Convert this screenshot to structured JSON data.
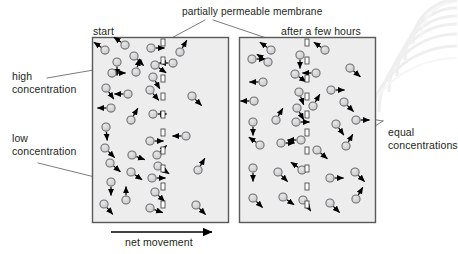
{
  "figure": {
    "type": "diagram",
    "canvas": {
      "width": 457,
      "height": 254,
      "background": "#ffffff"
    }
  },
  "labels": {
    "top_membrane": "partially permeable membrane",
    "panel_left_title": "start",
    "panel_right_title": "after a few hours",
    "high_concentration": "high\nconcentration",
    "high_concentration_line1": "high",
    "high_concentration_line2": "concentration",
    "low_concentration_line1": "low",
    "low_concentration_line2": "concentration",
    "equal_concentrations_line1": "equal",
    "equal_concentrations_line2": "concentrations",
    "net_movement": "net movement"
  },
  "colors": {
    "text": "#231f20",
    "panel_fill": "#ededed",
    "panel_stroke": "#58595b",
    "particle_fill": "#d2d3d4",
    "particle_stroke": "#6d6e70",
    "arrow": "#000000",
    "leader_line": "#58595b",
    "membrane_pore_fill": "#ffffff",
    "membrane_pore_stroke": "#414042",
    "membrane_band": "#bcbdc0",
    "watermark": "#f0f0f0"
  },
  "panels": [
    {
      "name": "start",
      "title": "start",
      "x": 92,
      "y": 37,
      "width": 136,
      "height": 185,
      "membrane_x": 163,
      "description": "high concentration of particles on the left of the membrane, low concentration on the right"
    },
    {
      "name": "after-a-few-hours",
      "title": "after a few hours",
      "x": 239,
      "y": 37,
      "width": 136,
      "height": 185,
      "membrane_x": 307,
      "description": "particles evenly spread on both sides of the membrane"
    }
  ],
  "membrane": {
    "pore_width": 4,
    "pore_height": 7,
    "pore_gap": 11,
    "band_width": 9,
    "pores_count_per_panel": 13
  },
  "net_movement_arrow": {
    "from_x": 111,
    "to_x": 212,
    "y": 232,
    "direction": "left-to-right"
  },
  "particles_left_panel": [
    {
      "x": 105,
      "y": 50,
      "ang": 215
    },
    {
      "x": 125,
      "y": 45,
      "ang": 215
    },
    {
      "x": 134,
      "y": 56,
      "ang": 45
    },
    {
      "x": 117,
      "y": 62,
      "ang": 90
    },
    {
      "x": 112,
      "y": 73,
      "ang": 0
    },
    {
      "x": 136,
      "y": 72,
      "ang": 285
    },
    {
      "x": 151,
      "y": 48,
      "ang": 0
    },
    {
      "x": 155,
      "y": 65,
      "ang": 35
    },
    {
      "x": 153,
      "y": 77,
      "ang": 60
    },
    {
      "x": 173,
      "y": 63,
      "ang": 180
    },
    {
      "x": 106,
      "y": 88,
      "ang": 55
    },
    {
      "x": 128,
      "y": 94,
      "ang": 180
    },
    {
      "x": 150,
      "y": 90,
      "ang": 50
    },
    {
      "x": 111,
      "y": 108,
      "ang": 180
    },
    {
      "x": 106,
      "y": 127,
      "ang": 85
    },
    {
      "x": 131,
      "y": 120,
      "ang": 300
    },
    {
      "x": 153,
      "y": 114,
      "ang": 0
    },
    {
      "x": 105,
      "y": 148,
      "ang": 45
    },
    {
      "x": 150,
      "y": 141,
      "ang": 0
    },
    {
      "x": 157,
      "y": 155,
      "ang": 315
    },
    {
      "x": 158,
      "y": 166,
      "ang": 35
    },
    {
      "x": 110,
      "y": 163,
      "ang": 40
    },
    {
      "x": 132,
      "y": 155,
      "ang": 20
    },
    {
      "x": 131,
      "y": 172,
      "ang": 35
    },
    {
      "x": 111,
      "y": 182,
      "ang": 90
    },
    {
      "x": 152,
      "y": 178,
      "ang": 0
    },
    {
      "x": 155,
      "y": 192,
      "ang": 45
    },
    {
      "x": 104,
      "y": 204,
      "ang": 50
    },
    {
      "x": 126,
      "y": 200,
      "ang": 270
    },
    {
      "x": 150,
      "y": 208,
      "ang": 20
    },
    {
      "x": 180,
      "y": 52,
      "ang": 300
    },
    {
      "x": 192,
      "y": 96,
      "ang": 45
    },
    {
      "x": 186,
      "y": 136,
      "ang": 180
    },
    {
      "x": 198,
      "y": 170,
      "ang": 300
    },
    {
      "x": 196,
      "y": 205,
      "ang": 45
    }
  ],
  "particles_right_panel": [
    {
      "x": 252,
      "y": 59,
      "ang": 0
    },
    {
      "x": 271,
      "y": 50,
      "ang": 215
    },
    {
      "x": 300,
      "y": 55,
      "ang": 90
    },
    {
      "x": 325,
      "y": 50,
      "ang": 215
    },
    {
      "x": 295,
      "y": 74,
      "ang": 35
    },
    {
      "x": 316,
      "y": 73,
      "ang": 180
    },
    {
      "x": 350,
      "y": 68,
      "ang": 40
    },
    {
      "x": 263,
      "y": 82,
      "ang": 180
    },
    {
      "x": 299,
      "y": 92,
      "ang": 70
    },
    {
      "x": 331,
      "y": 90,
      "ang": 0
    },
    {
      "x": 254,
      "y": 101,
      "ang": 180
    },
    {
      "x": 297,
      "y": 108,
      "ang": 60
    },
    {
      "x": 313,
      "y": 106,
      "ang": 300
    },
    {
      "x": 344,
      "y": 102,
      "ang": 45
    },
    {
      "x": 253,
      "y": 122,
      "ang": 90
    },
    {
      "x": 276,
      "y": 120,
      "ang": 300
    },
    {
      "x": 296,
      "y": 122,
      "ang": 0
    },
    {
      "x": 336,
      "y": 124,
      "ang": 55
    },
    {
      "x": 356,
      "y": 120,
      "ang": 0
    },
    {
      "x": 260,
      "y": 145,
      "ang": 215
    },
    {
      "x": 281,
      "y": 143,
      "ang": 0
    },
    {
      "x": 301,
      "y": 140,
      "ang": 180
    },
    {
      "x": 317,
      "y": 150,
      "ang": 40
    },
    {
      "x": 346,
      "y": 146,
      "ang": 300
    },
    {
      "x": 253,
      "y": 168,
      "ang": 90
    },
    {
      "x": 278,
      "y": 172,
      "ang": 45
    },
    {
      "x": 302,
      "y": 170,
      "ang": 215
    },
    {
      "x": 330,
      "y": 178,
      "ang": 0
    },
    {
      "x": 355,
      "y": 172,
      "ang": 45
    },
    {
      "x": 253,
      "y": 198,
      "ang": 45
    },
    {
      "x": 283,
      "y": 197,
      "ang": 35
    },
    {
      "x": 303,
      "y": 200,
      "ang": 55
    },
    {
      "x": 330,
      "y": 203,
      "ang": 45
    },
    {
      "x": 356,
      "y": 199,
      "ang": 300
    },
    {
      "x": 268,
      "y": 62,
      "ang": 215
    }
  ],
  "leader_lines": {
    "membrane_left": {
      "x1": 205,
      "y1": 20,
      "x2": 166,
      "y2": 41
    },
    "membrane_right": {
      "x1": 213,
      "y1": 20,
      "x2": 296,
      "y2": 48
    },
    "high_concentration": {
      "x1": 47,
      "y1": 78,
      "x2": 117,
      "y2": 66
    },
    "low_concentration": {
      "x1": 38,
      "y1": 163,
      "x2": 200,
      "y2": 203
    },
    "equal_top": {
      "x1": 383,
      "y1": 121,
      "x2": 277,
      "y2": 104
    },
    "equal_bottom": {
      "x1": 383,
      "y1": 121,
      "x2": 330,
      "y2": 155
    }
  }
}
